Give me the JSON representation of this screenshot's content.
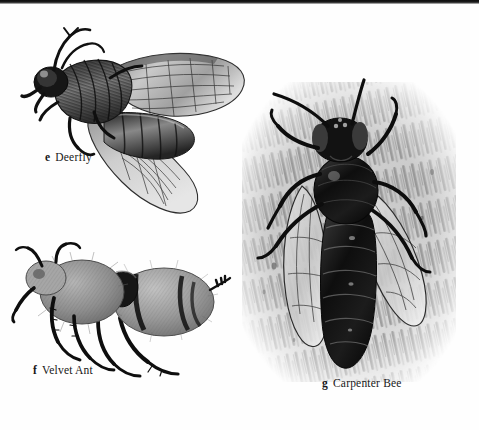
{
  "page": {
    "kind": "field-guide-plate",
    "background_color": "#fefefe",
    "ink_color": "#171717",
    "scan_edge_color": "#0d0d0d"
  },
  "figures": [
    {
      "letter": "e",
      "name": "Deerfly",
      "icon": "deerfly-illustration",
      "description": "Grayscale stipple illustration of a deerfly in side view, head to the upper left, two patterned wings swept back to the right and lower right, banded abdomen",
      "position": {
        "left": 18,
        "top": 22,
        "width": 230,
        "height": 190
      }
    },
    {
      "letter": "f",
      "name": "Velvet Ant",
      "icon": "velvet-ant-illustration",
      "description": "Grayscale illustration of a fuzzy wingless velvet ant in side view facing left, dense pile on thorax and abdomen with dark bands, long spiny legs",
      "position": {
        "left": 12,
        "top": 240,
        "width": 215,
        "height": 140
      }
    },
    {
      "letter": "g",
      "name": "Carpenter Bee",
      "icon": "carpenter-bee-illustration",
      "description": "Grayscale illustration of a carpenter bee viewed from above on a diagonally hatched wood-grain background, dark glossy segmented abdomen and two translucent veined wings",
      "position": {
        "left": 236,
        "top": 78,
        "width": 228,
        "height": 310
      }
    }
  ],
  "captions": {
    "deerfly": {
      "letter": "e",
      "label": "Deerfly"
    },
    "velvet_ant": {
      "letter": "f",
      "label": "Velvet Ant"
    },
    "carpenter_bee": {
      "letter": "g",
      "label": "Carpenter Bee"
    }
  }
}
